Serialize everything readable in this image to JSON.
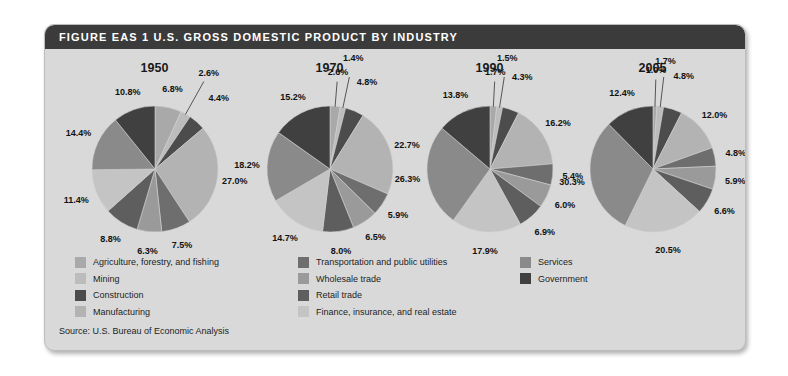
{
  "figure": {
    "header_title": "FIGURE EAS 1  U.S. GROSS DOMESTIC PRODUCT BY INDUSTRY",
    "source": "Source: U.S. Bureau of Economic Analysis"
  },
  "legend": {
    "columns": [
      [
        {
          "label": "Agriculture, forestry, and fishing",
          "color": "#a9a9a9"
        },
        {
          "label": "Mining",
          "color": "#bcbcbc"
        },
        {
          "label": "Construction",
          "color": "#4c4c4c"
        },
        {
          "label": "Manufacturing",
          "color": "#b3b3b3"
        }
      ],
      [
        {
          "label": "Transportation and public utilities",
          "color": "#6e6e6e"
        },
        {
          "label": "Wholesale trade",
          "color": "#9a9a9a"
        },
        {
          "label": "Retail trade",
          "color": "#5e5e5e"
        },
        {
          "label": "Finance, insurance, and real estate",
          "color": "#c4c4c4"
        }
      ],
      [
        {
          "label": "Services",
          "color": "#8a8a8a"
        },
        {
          "label": "Government",
          "color": "#404040"
        }
      ]
    ]
  },
  "chart_data": {
    "type": "pie",
    "title": "U.S. Gross Domestic Product by Industry",
    "legend_position": "bottom",
    "categories": [
      "Agriculture, forestry, and fishing",
      "Mining",
      "Construction",
      "Manufacturing",
      "Transportation and public utilities",
      "Wholesale trade",
      "Retail trade",
      "Finance, insurance, and real estate",
      "Services",
      "Government"
    ],
    "category_colors": [
      "#a9a9a9",
      "#bcbcbc",
      "#4c4c4c",
      "#b3b3b3",
      "#6e6e6e",
      "#9a9a9a",
      "#5e5e5e",
      "#c4c4c4",
      "#8a8a8a",
      "#404040"
    ],
    "unit": "percent",
    "pies": [
      {
        "title": "1950",
        "values": [
          6.8,
          2.6,
          4.4,
          27.0,
          7.5,
          6.3,
          8.8,
          11.4,
          14.4,
          10.8
        ],
        "labels": [
          "6.8%",
          "2.6%",
          "4.4%",
          "27.0%",
          "7.5%",
          "6.3%",
          "8.8%",
          "11.4%",
          "14.4%",
          "10.8%"
        ]
      },
      {
        "title": "1970",
        "values": [
          2.6,
          1.4,
          4.8,
          22.7,
          5.9,
          6.5,
          8.0,
          14.7,
          18.2,
          15.2
        ],
        "labels": [
          "2.6%",
          "1.4%",
          "4.8%",
          "22.7%",
          "5.9%",
          "6.5%",
          "8.0%",
          "14.7%",
          "18.2%",
          "15.2%"
        ]
      },
      {
        "title": "1990",
        "values": [
          1.7,
          1.5,
          4.3,
          16.2,
          5.4,
          6.0,
          6.9,
          17.9,
          26.3,
          13.8
        ],
        "labels": [
          "1.7%",
          "1.5%",
          "4.3%",
          "16.2%",
          "5.4%",
          "6.0%",
          "6.9%",
          "17.9%",
          "26.3%",
          "13.8%"
        ]
      },
      {
        "title": "2005",
        "values": [
          1.0,
          1.7,
          4.8,
          12.0,
          4.8,
          5.9,
          6.6,
          20.5,
          30.3,
          12.4
        ],
        "labels": [
          "1.0%",
          "1.7%",
          "4.8%",
          "12.0%",
          "4.8%",
          "5.9%",
          "6.6%",
          "20.5%",
          "30.3%",
          "12.4%"
        ]
      }
    ]
  }
}
